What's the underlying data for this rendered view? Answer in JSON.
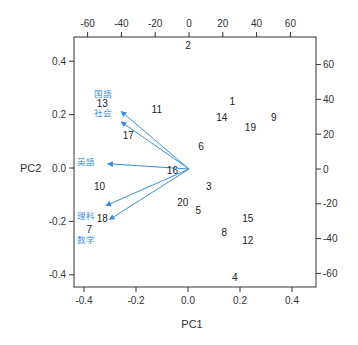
{
  "chart_data": {
    "type": "scatter",
    "subtype": "biplot",
    "title": "",
    "xlabel": "PC1",
    "ylabel": "PC2",
    "xlim": [
      -0.43,
      0.49
    ],
    "ylim": [
      -0.45,
      0.5
    ],
    "bottom_ticks": [
      -0.4,
      -0.2,
      0.0,
      0.2,
      0.4
    ],
    "bottom_tick_labels": [
      "-0.4",
      "-0.2",
      "0.0",
      "0.2",
      "0.4"
    ],
    "left_ticks": [
      0.4,
      0.2,
      0.0,
      -0.2,
      -0.4
    ],
    "left_tick_labels": [
      "0.4",
      "0.2",
      "0.0",
      "-0.2",
      "-0.4"
    ],
    "top_ticks": [
      -60,
      -40,
      -20,
      0,
      20,
      40,
      60
    ],
    "top_tick_labels": [
      "-60",
      "-40",
      "-20",
      "0",
      "20",
      "40",
      "60"
    ],
    "right_ticks": [
      60,
      40,
      20,
      0,
      -20,
      -40,
      -60
    ],
    "right_tick_labels": [
      "60",
      "40",
      "20",
      "0",
      "-20",
      "-40",
      "-60"
    ],
    "grid": false,
    "points": [
      {
        "label": "1",
        "x": 0.17,
        "y": 0.25
      },
      {
        "label": "2",
        "x": 0.0,
        "y": 0.46
      },
      {
        "label": "3",
        "x": 0.08,
        "y": -0.07
      },
      {
        "label": "4",
        "x": 0.18,
        "y": -0.41
      },
      {
        "label": "5",
        "x": 0.04,
        "y": -0.16
      },
      {
        "label": "6",
        "x": 0.05,
        "y": 0.08
      },
      {
        "label": "7",
        "x": -0.38,
        "y": -0.23
      },
      {
        "label": "8",
        "x": 0.14,
        "y": -0.24
      },
      {
        "label": "9",
        "x": 0.33,
        "y": 0.19
      },
      {
        "label": "10",
        "x": -0.34,
        "y": -0.07
      },
      {
        "label": "11",
        "x": -0.12,
        "y": 0.22
      },
      {
        "label": "12",
        "x": 0.23,
        "y": -0.27
      },
      {
        "label": "13",
        "x": -0.33,
        "y": 0.24
      },
      {
        "label": "14",
        "x": 0.13,
        "y": 0.19
      },
      {
        "label": "15",
        "x": 0.23,
        "y": -0.19
      },
      {
        "label": "16",
        "x": -0.06,
        "y": -0.01
      },
      {
        "label": "17",
        "x": -0.23,
        "y": 0.12
      },
      {
        "label": "18",
        "x": -0.33,
        "y": -0.19
      },
      {
        "label": "19",
        "x": 0.24,
        "y": 0.15
      },
      {
        "label": "20",
        "x": -0.02,
        "y": -0.13
      }
    ],
    "loadings": [
      {
        "label": "国語",
        "x": -40,
        "y": 33,
        "label_x": -51,
        "label_y": 43
      },
      {
        "label": "社会",
        "x": -40,
        "y": 27,
        "label_x": -51,
        "label_y": 32
      },
      {
        "label": "英語",
        "x": -48,
        "y": 3,
        "label_x": -61,
        "label_y": 4
      },
      {
        "label": "理科",
        "x": -49,
        "y": -21,
        "label_x": -61,
        "label_y": -27
      },
      {
        "label": "数学",
        "x": -47,
        "y": -29,
        "label_x": -61,
        "label_y": -41
      }
    ],
    "colors": {
      "points": "#222222",
      "loadings": "#3a8fd6",
      "axis": "#333333"
    }
  }
}
